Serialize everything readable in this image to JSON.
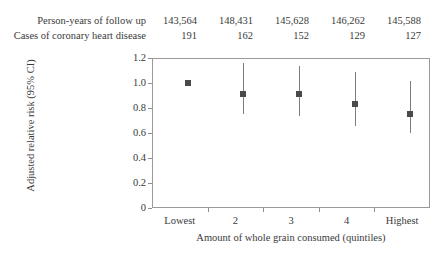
{
  "header": {
    "rows": [
      {
        "label": "Person-years of follow up",
        "values": [
          "143,564",
          "148,431",
          "145,628",
          "146,262",
          "145,588"
        ]
      },
      {
        "label": "Cases of coronary heart disease",
        "values": [
          "191",
          "162",
          "152",
          "129",
          "127"
        ]
      }
    ]
  },
  "chart_data": {
    "type": "scatter",
    "title": "",
    "xlabel": "Amount of whole grain consumed (quintiles)",
    "ylabel": "Adjusted relative risk (95% CI)",
    "categories": [
      "Lowest",
      "2",
      "3",
      "4",
      "Highest"
    ],
    "values": [
      1.0,
      0.91,
      0.91,
      0.83,
      0.75
    ],
    "ci_low": [
      null,
      0.75,
      0.74,
      0.66,
      0.6
    ],
    "ci_high": [
      null,
      1.16,
      1.14,
      1.09,
      1.02
    ],
    "ylim": [
      0,
      1.2
    ],
    "ytick_labels": [
      "1.2",
      "1.0",
      "0.8",
      "0.6",
      "0.4",
      "0.2",
      "0"
    ],
    "ytick_values": [
      1.2,
      1.0,
      0.8,
      0.6,
      0.4,
      0.2,
      0
    ],
    "grid": false,
    "legend": null,
    "marker_color": "#4a4a4a",
    "line_color": "#7d7d7d",
    "axis_color": "#9a9a9a"
  }
}
